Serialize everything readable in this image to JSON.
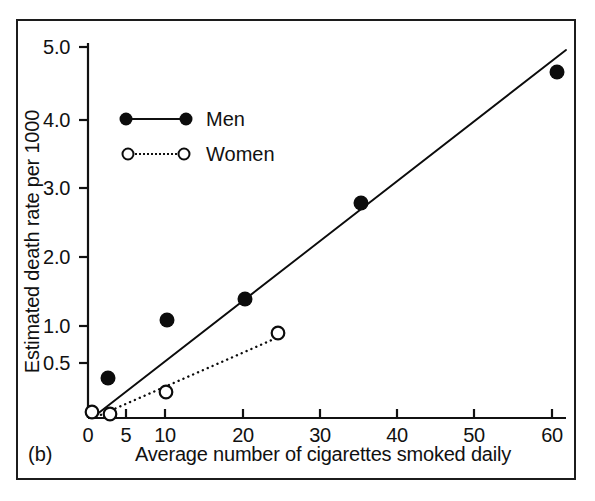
{
  "panel": {
    "letter": "(b)"
  },
  "chart_data": {
    "type": "scatter",
    "title": "",
    "xlabel": "Average number of cigarettes smoked daily",
    "ylabel": "Estimated death rate per 1000",
    "xlim": [
      0,
      60
    ],
    "ylim": [
      0,
      5.0
    ],
    "grid": false,
    "legend_position": "upper-left",
    "x_ticks": [
      {
        "value": 0,
        "label": "0",
        "px": 88
      },
      {
        "value": 5,
        "label": "5",
        "px": 126
      },
      {
        "value": 10,
        "label": "10",
        "px": 165
      },
      {
        "value": 20,
        "label": "20",
        "px": 243
      },
      {
        "value": 30,
        "label": "30",
        "px": 320
      },
      {
        "value": 40,
        "label": "40",
        "px": 397
      },
      {
        "value": 50,
        "label": "50",
        "px": 474
      },
      {
        "value": 60,
        "label": "60",
        "px": 552
      }
    ],
    "y_ticks": [
      {
        "value": 0.5,
        "label": "0.5",
        "px": 363
      },
      {
        "value": 1.0,
        "label": "1.0",
        "px": 326
      },
      {
        "value": 2.0,
        "label": "2.0",
        "px": 257
      },
      {
        "value": 3.0,
        "label": "3.0",
        "px": 188
      },
      {
        "value": 4.0,
        "label": "4.0",
        "px": 120
      },
      {
        "value": 5.0,
        "label": "5.0",
        "px": 47
      }
    ],
    "series": [
      {
        "name": "Men",
        "marker": "filled-circle",
        "line": "solid",
        "color": "#0c0c0c",
        "points": [
          {
            "x": 2.6,
            "y": 0.55,
            "px": 108,
            "py": 378
          },
          {
            "x": 10,
            "y": 1.35,
            "px": 167,
            "py": 320
          },
          {
            "x": 20,
            "y": 1.63,
            "px": 245,
            "py": 299
          },
          {
            "x": 35,
            "y": 2.92,
            "px": 361,
            "py": 203
          },
          {
            "x": 60.5,
            "y": 4.7,
            "px": 557,
            "py": 72
          }
        ],
        "fit_line": {
          "x0px": 96,
          "y0px": 415,
          "x1px": 566,
          "y1px": 50
        }
      },
      {
        "name": "Women",
        "marker": "open-circle",
        "line": "dotted",
        "color": "#0c0c0c",
        "points": [
          {
            "x": 0.6,
            "y": 0.08,
            "px": 92,
            "py": 412
          },
          {
            "x": 3.0,
            "y": 0.07,
            "px": 110,
            "py": 414
          },
          {
            "x": 10,
            "y": 0.42,
            "px": 166,
            "py": 392
          },
          {
            "x": 24.5,
            "y": 1.18,
            "px": 278,
            "py": 333
          }
        ],
        "fit_line": {
          "x0px": 96,
          "y0px": 417,
          "x1px": 281,
          "y1px": 336
        }
      }
    ],
    "legend": [
      {
        "label": "Men",
        "marker": "filled-circle",
        "line": "solid"
      },
      {
        "label": "Women",
        "marker": "open-circle",
        "line": "dotted"
      }
    ]
  }
}
